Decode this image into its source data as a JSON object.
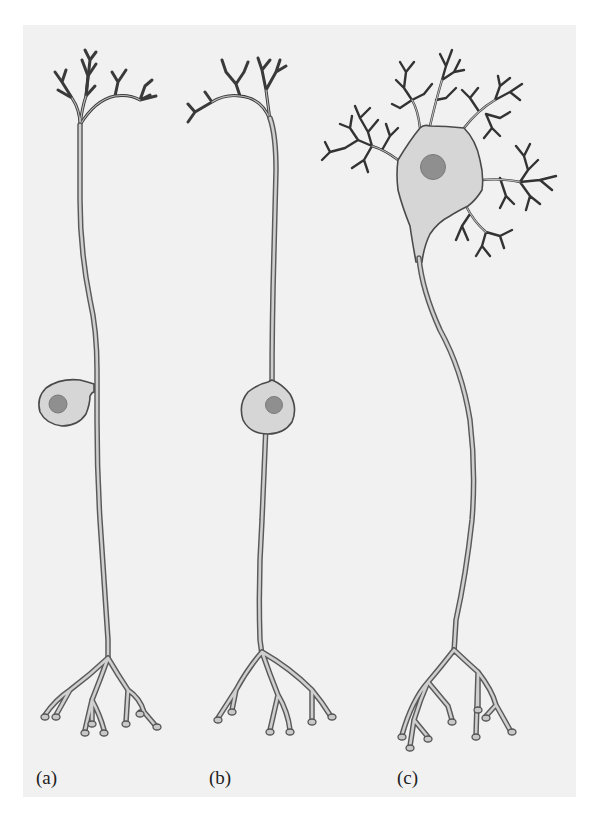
{
  "figure": {
    "background_color": "#f1f1f1",
    "panels": [
      {
        "id": "a",
        "label": "(a)",
        "cell_type": "unipolar neuron"
      },
      {
        "id": "b",
        "label": "(b)",
        "cell_type": "bipolar neuron"
      },
      {
        "id": "c",
        "label": "(c)",
        "cell_type": "multipolar neuron"
      }
    ]
  },
  "colors": {
    "soma_fill": "#d6d6d6",
    "outline": "#4a4a4a",
    "nucleus": "#8f8f8f",
    "dendrite": "#3a3a3a"
  }
}
